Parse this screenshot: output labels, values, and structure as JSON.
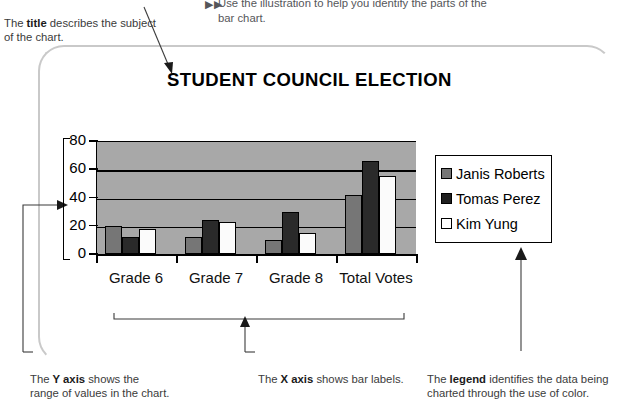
{
  "instruction": {
    "bullet_marker": "▶▶",
    "text": "Use the illustration to help you identify the parts of the\nbar chart."
  },
  "annotations": {
    "title_note": {
      "prefix": "The ",
      "term": "title",
      "suffix": " describes the subject of the chart."
    },
    "yaxis_note": {
      "prefix": "The ",
      "term": "Y axis",
      "suffix": " shows the range of values in the chart."
    },
    "xaxis_note": {
      "prefix": "The ",
      "term": "X axis",
      "suffix": " shows bar labels."
    },
    "legend_note": {
      "prefix": "The ",
      "term": "legend",
      "suffix": " identifies the data being charted through the use of color."
    }
  },
  "chart_data": {
    "type": "bar",
    "title": "STUDENT COUNCIL ELECTION",
    "xlabel": "",
    "ylabel": "",
    "categories": [
      "Grade 6",
      "Grade 7",
      "Grade 8",
      "Total Votes"
    ],
    "series": [
      {
        "name": "Janis Roberts",
        "color": "#767676",
        "values": [
          20,
          12,
          10,
          42
        ]
      },
      {
        "name": "Tomas Perez",
        "color": "#1f1f1f",
        "values": [
          12,
          24,
          30,
          66
        ]
      },
      {
        "name": "Kim Yung",
        "color": "#ffffff",
        "values": [
          18,
          23,
          15,
          55
        ]
      }
    ],
    "yticks": [
      0,
      20,
      40,
      60,
      80
    ],
    "ylim": [
      0,
      80
    ],
    "grid": true,
    "legend_position": "right",
    "plot_background": "#a8a8a8"
  }
}
